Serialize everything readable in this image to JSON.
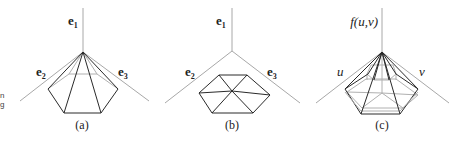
{
  "figure": {
    "panels": [
      {
        "id": "a",
        "caption": "(a)",
        "axis_labels": {
          "top": "e",
          "top_sub": "1",
          "left": "e",
          "left_sub": "2",
          "right": "e",
          "right_sub": "3"
        },
        "description": "Pyramid: apex joined to pentagon base"
      },
      {
        "id": "b",
        "caption": "(b)",
        "axis_labels": {
          "top": "e",
          "top_sub": "1",
          "left": "e",
          "left_sub": "2",
          "right": "e",
          "right_sub": "3"
        },
        "description": "Flat hexagon triangulated from center"
      },
      {
        "id": "c",
        "caption": "(c)",
        "axis_labels": {
          "top": "f(u,v)",
          "left": "u",
          "right": "v"
        },
        "description": "Pyramid over pentagon with inner hexagon overlay"
      }
    ],
    "left_edge_fragment": {
      "line1": "n",
      "line2": "g"
    }
  }
}
